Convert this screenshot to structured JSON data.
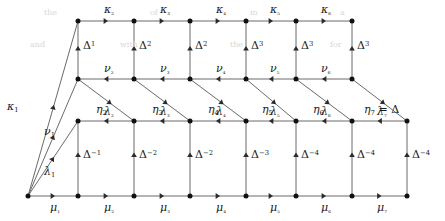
{
  "figure": {
    "type": "commutative-lattice-diagram",
    "width": 445,
    "height": 221,
    "stroke_color": "#3a3a3a",
    "node_color": "#111111",
    "background": "#ffffff"
  },
  "geometry": {
    "origin": {
      "x": 28,
      "y": 196
    },
    "columns": [
      78,
      134,
      190,
      246,
      296,
      352,
      407
    ],
    "rows": {
      "kappa": 21,
      "nu": 79,
      "lambda": 121,
      "mu": 196
    }
  },
  "rows": [
    {
      "id": "kappa-row",
      "arrow_direction": "right",
      "edge_labels": [
        "κ₂",
        "κ₃",
        "κ₄",
        "κ₅",
        "κ₆"
      ],
      "node_count": 6
    },
    {
      "id": "nu-row",
      "arrow_direction": "left",
      "edge_labels": [
        "ν₂",
        "ν₃",
        "ν₄",
        "ν₅",
        "ν₆"
      ],
      "node_count": 6
    },
    {
      "id": "lambda-row",
      "arrow_direction": "left",
      "edge_labels": [
        "λ₂",
        "λ₃",
        "λ₄",
        "λ₅",
        "λ₆",
        "λ₇"
      ],
      "node_count": 7
    },
    {
      "id": "mu-row",
      "arrow_direction": "right",
      "edge_labels": [
        "μ₁",
        "μ₂",
        "μ₃",
        "μ₄",
        "μ₅",
        "μ₆",
        "μ₇"
      ],
      "node_count": 8
    }
  ],
  "origin_edges": [
    {
      "id": "kappa-1",
      "label": "κ",
      "sub": "1",
      "target_row": "kappa",
      "target_col": 0,
      "label_x": 7,
      "label_y": 101
    },
    {
      "id": "nu-1",
      "label": "ν",
      "sub": "1",
      "target_row": "nu",
      "target_col": 0,
      "label_x": 44,
      "label_y": 126
    },
    {
      "id": "lambda-1",
      "label": "λ",
      "sub": "1",
      "target_row": "lambda",
      "target_col": 0,
      "label_x": 44,
      "label_y": 166
    }
  ],
  "vertical_edges_upper": {
    "note": "kappa-row to nu-row, arrows point up",
    "labels": [
      {
        "base": "Δ",
        "exp": "1"
      },
      {
        "base": "Δ",
        "exp": "2"
      },
      {
        "base": "Δ",
        "exp": "2"
      },
      {
        "base": "Δ",
        "exp": "3"
      },
      {
        "base": "Δ",
        "exp": "3"
      },
      {
        "base": "Δ",
        "exp": "3"
      }
    ]
  },
  "vertical_edges_lower": {
    "note": "mu-row to lambda-row, arrows point up",
    "labels": [
      {
        "base": "Δ",
        "exp": "−1"
      },
      {
        "base": "Δ",
        "exp": "−2"
      },
      {
        "base": "Δ",
        "exp": "−2"
      },
      {
        "base": "Δ",
        "exp": "−3"
      },
      {
        "base": "Δ",
        "exp": "−4"
      },
      {
        "base": "Δ",
        "exp": "−4"
      },
      {
        "base": "Δ",
        "exp": "−4"
      }
    ]
  },
  "diagonal_edges_eta": {
    "note": "from nu-row node i to lambda-row node i+1, arrows point down-right",
    "labels": [
      {
        "text": "η",
        "sub": "2",
        "x": 96,
        "y": 104
      },
      {
        "text": "η",
        "sub": "3",
        "x": 152,
        "y": 104
      },
      {
        "text": "η",
        "sub": "4",
        "x": 208,
        "y": 104
      },
      {
        "text": "η",
        "sub": "5",
        "x": 262,
        "y": 104
      },
      {
        "text": "η",
        "sub": "6",
        "x": 313,
        "y": 104
      },
      {
        "text": "η",
        "sub": "7",
        "x": 364,
        "y": 104,
        "suffix": " = Δ"
      }
    ]
  },
  "kappa_row_labels_x": [
    104,
    160,
    216,
    270,
    321
  ],
  "nu_row_labels_x": [
    104,
    160,
    216,
    270,
    321
  ],
  "lambda_row_labels_x": [
    104,
    160,
    216,
    270,
    321,
    377
  ],
  "mu_row_labels_x": [
    50,
    104,
    160,
    216,
    270,
    321,
    377
  ],
  "delta_upper_x": [
    83,
    139,
    195,
    251,
    301,
    357
  ],
  "delta_lower_x": [
    83,
    139,
    195,
    251,
    301,
    357,
    412
  ],
  "ghost_text": [
    {
      "t": "the",
      "x": 44,
      "y": 8
    },
    {
      "t": "of",
      "x": 150,
      "y": 8
    },
    {
      "t": "in",
      "x": 250,
      "y": 8
    },
    {
      "t": "a",
      "x": 340,
      "y": 8
    },
    {
      "t": "and",
      "x": 30,
      "y": 40
    },
    {
      "t": "with",
      "x": 120,
      "y": 40
    },
    {
      "t": "the",
      "x": 230,
      "y": 40
    },
    {
      "t": "for",
      "x": 330,
      "y": 40
    }
  ]
}
